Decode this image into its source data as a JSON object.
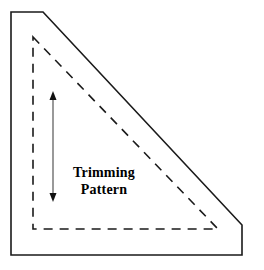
{
  "figure": {
    "type": "technical-diagram",
    "title": "Trimming Pattern",
    "background_color": "#ffffff",
    "stroke_color": "#1a1a1a",
    "dash_color": "#1a1a1a",
    "canvas": {
      "width": 264,
      "height": 270
    }
  },
  "labels": {
    "line1": "Trimming",
    "line2": "Pattern"
  },
  "shapes": {
    "outer_outline": {
      "name": "cut-corner-right-triangle",
      "style": "solid",
      "stroke_width": 1.6,
      "points": "11,12 43,12 242,225 242,255 11,255"
    },
    "inner_outline": {
      "name": "trimming-pattern-triangle",
      "style": "dashed",
      "stroke_width": 1.6,
      "dash_array": "9,7",
      "points": "33,37 218,229 33,229"
    },
    "measure_arrow": {
      "name": "vertical-double-arrow",
      "x": 53,
      "y_top": 93,
      "y_bottom": 200,
      "stroke_width": 1.2,
      "head_width": 7,
      "head_length": 9
    }
  },
  "label_position": {
    "left": 59,
    "top": 164,
    "width": 90
  }
}
